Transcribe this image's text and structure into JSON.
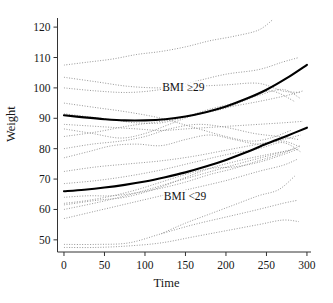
{
  "chart_data": {
    "type": "line",
    "title": "",
    "xlabel": "Time",
    "ylabel": "Weight",
    "xlim": [
      -8,
      305
    ],
    "ylim": [
      46,
      123
    ],
    "grid": false,
    "legend_position": "inline-annotations",
    "xticks": [
      0,
      50,
      100,
      150,
      200,
      250,
      300
    ],
    "yticks": [
      50,
      60,
      70,
      80,
      90,
      100,
      110,
      120
    ],
    "xtick_labels": [
      "0",
      "50",
      "100",
      "150",
      "200",
      "250",
      "300"
    ],
    "ytick_labels": [
      "50",
      "60",
      "70",
      "80",
      "90",
      "100",
      "110",
      "120"
    ],
    "annotations": [
      {
        "text": "BMI ≥29",
        "x": 120,
        "y": 100,
        "series": "mean-bmi-ge-29"
      },
      {
        "text": "BMI <29",
        "x": 122,
        "y": 64,
        "series": "mean-bmi-lt-29"
      }
    ],
    "series": [
      {
        "name": "Mean trajectory BMI ≥29",
        "style": "solid-bold",
        "color": "#000000",
        "x": [
          0,
          25,
          50,
          75,
          100,
          125,
          150,
          175,
          200,
          225,
          250,
          275,
          300
        ],
        "values": [
          91.0,
          90.3,
          89.7,
          89.3,
          89.3,
          89.7,
          90.6,
          92.0,
          93.9,
          96.4,
          99.4,
          103.2,
          107.6
        ]
      },
      {
        "name": "Mean trajectory BMI <29",
        "style": "solid-bold",
        "color": "#000000",
        "x": [
          0,
          25,
          50,
          75,
          100,
          125,
          150,
          175,
          200,
          225,
          250,
          275,
          300
        ],
        "values": [
          66.0,
          66.5,
          67.2,
          68.1,
          69.2,
          70.6,
          72.2,
          74.1,
          76.3,
          78.8,
          81.6,
          84.2,
          86.9
        ]
      },
      {
        "name": "Subject 1",
        "style": "dotted",
        "color": "#8c8c8c",
        "x": [
          0,
          30,
          60,
          90,
          120,
          150,
          180,
          210,
          240,
          258
        ],
        "values": [
          107.5,
          108.5,
          109.5,
          111.0,
          112.0,
          113.5,
          115.5,
          117.0,
          119.0,
          122.5
        ]
      },
      {
        "name": "Subject 2",
        "style": "dotted",
        "color": "#8c8c8c",
        "x": [
          0,
          40,
          80,
          120,
          160,
          200,
          240,
          270,
          290
        ],
        "values": [
          100.0,
          99.0,
          98.5,
          99.5,
          102.0,
          104.5,
          106.0,
          108.5,
          110.0
        ]
      },
      {
        "name": "Subject 3",
        "style": "dotted",
        "color": "#8c8c8c",
        "x": [
          0,
          40,
          80,
          120,
          160,
          200,
          240,
          270,
          292
        ],
        "values": [
          103.5,
          102.0,
          100.5,
          100.0,
          100.5,
          101.0,
          101.5,
          99.0,
          98.5
        ]
      },
      {
        "name": "Subject 4",
        "style": "dotted",
        "color": "#8c8c8c",
        "x": [
          0,
          30,
          60,
          90,
          120,
          150,
          180,
          210,
          240,
          270,
          292
        ],
        "values": [
          91.5,
          90.5,
          89.5,
          88.5,
          88.5,
          90.5,
          93.0,
          95.0,
          97.5,
          99.5,
          96.5
        ]
      },
      {
        "name": "Subject 5",
        "style": "dotted",
        "color": "#8c8c8c",
        "x": [
          0,
          30,
          60,
          90,
          120,
          150,
          180,
          210,
          240,
          270,
          295
        ],
        "values": [
          88.0,
          87.5,
          87.0,
          86.5,
          86.0,
          86.5,
          87.0,
          87.5,
          88.0,
          88.5,
          89.0
        ]
      },
      {
        "name": "Subject 6",
        "style": "dotted",
        "color": "#8c8c8c",
        "x": [
          0,
          40,
          80,
          120,
          160,
          200,
          240,
          275,
          295
        ],
        "values": [
          84.0,
          85.5,
          87.5,
          89.0,
          91.0,
          93.5,
          95.5,
          97.5,
          99.0
        ]
      },
      {
        "name": "Subject 7",
        "style": "dotted",
        "color": "#8c8c8c",
        "x": [
          0,
          30,
          60,
          90,
          120,
          150,
          180,
          210,
          240,
          270,
          292
        ],
        "values": [
          77.0,
          79.0,
          81.0,
          81.5,
          81.0,
          83.0,
          84.5,
          83.0,
          81.5,
          82.5,
          80.5
        ]
      },
      {
        "name": "Subject 8",
        "style": "dotted",
        "color": "#8c8c8c",
        "x": [
          0,
          40,
          80,
          120,
          160,
          200,
          240,
          270,
          292
        ],
        "values": [
          72.5,
          74.0,
          75.0,
          76.0,
          77.5,
          79.5,
          81.5,
          83.0,
          84.5
        ]
      },
      {
        "name": "Subject 9",
        "style": "dotted",
        "color": "#8c8c8c",
        "x": [
          0,
          40,
          80,
          120,
          160,
          200,
          240,
          270,
          292
        ],
        "values": [
          68.5,
          69.5,
          71.0,
          73.0,
          75.5,
          78.0,
          80.0,
          82.0,
          79.0
        ]
      },
      {
        "name": "Subject 10",
        "style": "dotted",
        "color": "#8c8c8c",
        "x": [
          0,
          30,
          60,
          90,
          120,
          150,
          180,
          210,
          240,
          270,
          292
        ],
        "values": [
          64.0,
          64.5,
          64.5,
          65.5,
          67.0,
          69.0,
          71.5,
          73.5,
          76.0,
          78.5,
          81.0
        ]
      },
      {
        "name": "Subject 11",
        "style": "dotted",
        "color": "#8c8c8c",
        "x": [
          0,
          30,
          60,
          90,
          120,
          150,
          180,
          210,
          240,
          270,
          290
        ],
        "values": [
          62.0,
          63.0,
          64.5,
          66.5,
          69.0,
          71.5,
          73.5,
          74.0,
          75.5,
          78.0,
          80.0
        ]
      },
      {
        "name": "Subject 12",
        "style": "dotted",
        "color": "#8c8c8c",
        "x": [
          0,
          40,
          80,
          120,
          160,
          200,
          240,
          270,
          288
        ],
        "values": [
          57.0,
          59.5,
          62.0,
          64.5,
          67.0,
          69.5,
          72.5,
          74.5,
          76.5
        ]
      },
      {
        "name": "Subject 13",
        "style": "dotted",
        "color": "#8c8c8c",
        "x": [
          0,
          40,
          80,
          120,
          160,
          200,
          240,
          270,
          288
        ],
        "values": [
          48.5,
          48.5,
          49.0,
          52.0,
          55.0,
          57.5,
          60.0,
          62.0,
          63.0
        ]
      },
      {
        "name": "Subject 14",
        "style": "dotted",
        "color": "#8c8c8c",
        "x": [
          0,
          40,
          80,
          120,
          160,
          200,
          240,
          270,
          290
        ],
        "values": [
          47.5,
          47.5,
          48.0,
          49.0,
          51.0,
          53.0,
          55.0,
          56.5,
          56.0
        ]
      },
      {
        "name": "Subject 15",
        "style": "dotted",
        "color": "#8c8c8c",
        "x": [
          120,
          150,
          180,
          210,
          240,
          265,
          285
        ],
        "values": [
          52.0,
          55.5,
          58.5,
          61.5,
          64.5,
          66.5,
          71.0
        ]
      },
      {
        "name": "Subject 16",
        "style": "dotted",
        "color": "#8c8c8c",
        "x": [
          0,
          40,
          80,
          120,
          160,
          200,
          230,
          255,
          280
        ],
        "values": [
          95.0,
          93.5,
          92.0,
          90.0,
          87.0,
          84.0,
          82.5,
          83.5,
          86.0
        ]
      },
      {
        "name": "Subject 17",
        "style": "dotted",
        "color": "#8c8c8c",
        "x": [
          0,
          35,
          70,
          100,
          130,
          160,
          195,
          225,
          255,
          285
        ],
        "values": [
          86.5,
          85.0,
          83.5,
          85.0,
          88.0,
          91.0,
          93.0,
          96.0,
          99.0,
          95.5
        ]
      },
      {
        "name": "Subject 18",
        "style": "dotted",
        "color": "#8c8c8c",
        "x": [
          0,
          35,
          70,
          100,
          130,
          165,
          200,
          235,
          265,
          290
        ],
        "values": [
          80.0,
          81.5,
          82.5,
          84.0,
          86.5,
          88.0,
          87.0,
          85.0,
          84.0,
          83.0
        ]
      },
      {
        "name": "Subject 19",
        "style": "dotted",
        "color": "#8c8c8c",
        "x": [
          0,
          40,
          75,
          110,
          145,
          180,
          215,
          250,
          280
        ],
        "values": [
          61.5,
          63.0,
          64.0,
          66.5,
          70.0,
          73.5,
          76.0,
          78.0,
          79.5
        ]
      },
      {
        "name": "Subject 20",
        "style": "dotted",
        "color": "#8c8c8c",
        "x": [
          0,
          45,
          90,
          135,
          175,
          215,
          250,
          285
        ],
        "values": [
          60.0,
          62.5,
          65.5,
          69.0,
          72.0,
          75.0,
          77.5,
          80.0
        ]
      }
    ]
  },
  "axis": {
    "line_color": "#333333",
    "tick_length": 4
  }
}
